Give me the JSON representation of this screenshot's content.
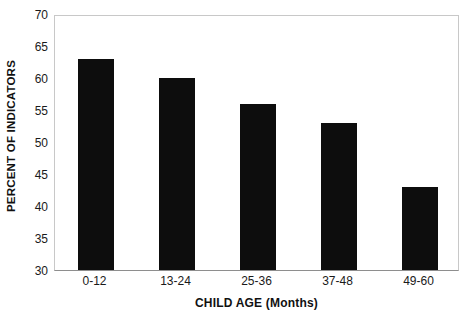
{
  "chart_data": {
    "type": "bar",
    "title": "",
    "categories": [
      "0-12",
      "13-24",
      "25-36",
      "37-48",
      "49-60"
    ],
    "values": [
      63,
      60,
      56,
      53,
      43
    ],
    "series": [
      {
        "name": "Percent of indicators",
        "values": [
          63,
          60,
          56,
          53,
          43
        ]
      }
    ],
    "xlabel": "CHILD AGE (Months)",
    "ylabel": "PERCENT OF INDICATORS",
    "ylim": [
      30,
      70
    ],
    "ytick_interval": 5,
    "yticks": [
      70,
      65,
      60,
      55,
      50,
      45,
      40,
      35,
      30
    ],
    "ytick_labels": [
      "70",
      "65",
      "60",
      "55",
      "50",
      "45",
      "40",
      "35",
      "30"
    ],
    "grid": false,
    "legend": false,
    "legend_position": "none",
    "bar_color": "#0d0d0d",
    "frame_color": "#c8c8c8",
    "background_color": "#ffffff"
  }
}
